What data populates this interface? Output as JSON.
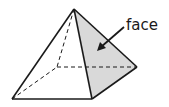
{
  "diagram": {
    "type": "square-pyramid",
    "label": "face",
    "colors": {
      "edge": "#1a1a1a",
      "face_fill": "#d9d9d9",
      "background": "#ffffff"
    },
    "vertices": {
      "apex": [
        74,
        9
      ],
      "front_left": [
        12,
        99
      ],
      "front_right": [
        92,
        99
      ],
      "back_right": [
        137,
        67
      ],
      "back_left_hidden": [
        57,
        67
      ]
    },
    "highlighted_face": "right lateral face (apex, front_right, back_right)",
    "arrow": {
      "from": [
        124,
        27
      ],
      "to": [
        98,
        50
      ]
    }
  }
}
